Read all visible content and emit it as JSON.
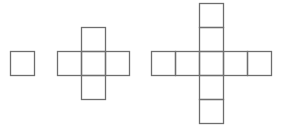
{
  "diagram": {
    "stroke_color": "#6e6e6e",
    "cell_size": 24,
    "figures": [
      {
        "name": "figure-1",
        "cells": [
          [
            10,
            51
          ]
        ]
      },
      {
        "name": "figure-2",
        "cells": [
          [
            81,
            27
          ],
          [
            57,
            51
          ],
          [
            81,
            51
          ],
          [
            105,
            51
          ],
          [
            81,
            75
          ]
        ]
      },
      {
        "name": "figure-3",
        "cells": [
          [
            199,
            3
          ],
          [
            199,
            27
          ],
          [
            151,
            51
          ],
          [
            175,
            51
          ],
          [
            199,
            51
          ],
          [
            223,
            51
          ],
          [
            247,
            51
          ],
          [
            199,
            75
          ],
          [
            199,
            99
          ]
        ]
      }
    ]
  }
}
